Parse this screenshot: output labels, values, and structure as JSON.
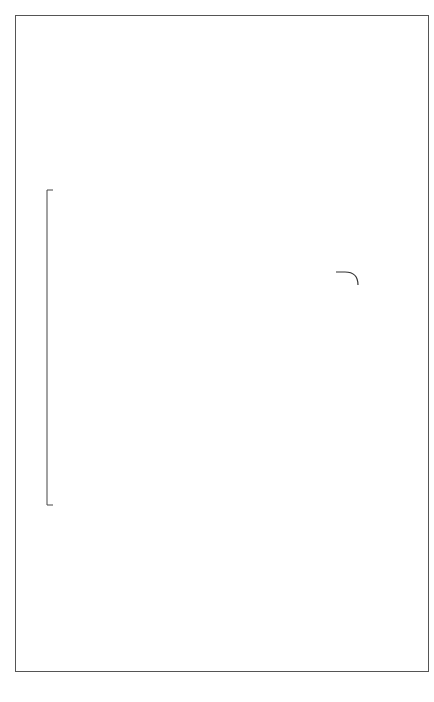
{
  "depth_zone": {
    "title": "DEPTH ZONE",
    "shallow_label": "SHALLOW",
    "deep_label": "DEEP"
  },
  "shallow": {
    "shelters": "DAMSELFISH\nSHELTERS\nNUMEROUS",
    "densities": "DAMSELFISH\nDENSITIES",
    "interference": "Interference\nwith Grazers",
    "pocillopora": "Pocillopora\nRECRUITMENT",
    "pavona": "Pavona\nGROWTH",
    "overtopping": "Overtopping",
    "outcome": "Predominant coral\nin shallow water",
    "signs": {
      "shelters_to_densities": "+",
      "densities_to_interference": "+",
      "interference_to_pocillopora": "+",
      "densities_to_pavona": "-",
      "pocillopora_to_pavona": "-"
    }
  },
  "deep": {
    "shelters": "DAMSELFISH\nSHELTERS\nRARE",
    "densities": "DAMSELFISH\nDENSITIES",
    "interference": "Interference\nwith Grazers",
    "pocillopora": "Pocillopora\nRECRUITMENT",
    "pavona": "Pavona\nGROWTH",
    "coral_note": "Coral density\nlow",
    "interaction_note": "Interactions\nweak",
    "outcome": "Predominant coral\nin deep water",
    "signs": {
      "shelters_to_densities": "-",
      "densities_to_interference": "-",
      "interference_to_pocillopora": "-",
      "densities_to_pavona": "+"
    }
  },
  "illustration": "damselfish"
}
